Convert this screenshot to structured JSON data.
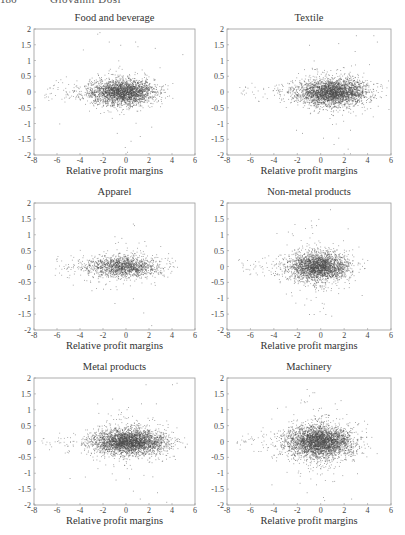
{
  "running_head": {
    "page_number": "186",
    "author": "Giovanni Dosi"
  },
  "chart_data": [
    {
      "type": "scatter",
      "title": "Food and beverage",
      "xlabel": "Relative profit margins",
      "ylabel": "",
      "xlim": [
        -8,
        6
      ],
      "ylim": [
        -2,
        2
      ],
      "xticks": [
        -8,
        -6,
        -4,
        -2,
        0,
        2,
        4,
        6
      ],
      "yticks": [
        2,
        1.5,
        1,
        0.5,
        0,
        -0.5,
        -1,
        -1.5,
        -2
      ],
      "grid": false,
      "cluster": {
        "center_x": -0.3,
        "center_y": 0.0,
        "sd_x": 1.4,
        "sd_y": 0.17,
        "n": 2600
      },
      "tail": {
        "x_min": -7.2,
        "x_max": 5.0
      },
      "outliers": [
        [
          -2.5,
          1.85
        ],
        [
          -2.3,
          1.9
        ],
        [
          -1.5,
          1.6
        ],
        [
          -0.5,
          1.5
        ],
        [
          0.8,
          1.6
        ],
        [
          1.0,
          1.45
        ],
        [
          2.5,
          1.4
        ],
        [
          4.9,
          1.2
        ],
        [
          -5.8,
          -1.0
        ],
        [
          -0.8,
          -1.3
        ],
        [
          0.4,
          -1.55
        ],
        [
          -0.1,
          -1.75
        ],
        [
          0.1,
          -1.9
        ],
        [
          1.2,
          -1.4
        ],
        [
          2.2,
          -1.1
        ]
      ]
    },
    {
      "type": "scatter",
      "title": "Textile",
      "xlabel": "Relative profit margins",
      "ylabel": "",
      "xlim": [
        -8,
        6
      ],
      "ylim": [
        -2,
        2
      ],
      "xticks": [
        -8,
        -6,
        -4,
        -2,
        0,
        2,
        4,
        6
      ],
      "yticks": [
        2,
        1.5,
        1,
        0.5,
        0,
        -0.5,
        -1,
        -1.5,
        -2
      ],
      "grid": false,
      "cluster": {
        "center_x": 1.0,
        "center_y": 0.0,
        "sd_x": 1.5,
        "sd_y": 0.18,
        "n": 3000
      },
      "tail": {
        "x_min": -7.0,
        "x_max": 5.8
      },
      "outliers": [
        [
          -1.0,
          1.5
        ],
        [
          1.5,
          1.55
        ],
        [
          3.0,
          1.8
        ],
        [
          4.5,
          1.8
        ],
        [
          4.8,
          1.6
        ],
        [
          2.9,
          1.3
        ],
        [
          -0.6,
          1.0
        ],
        [
          -2.1,
          -1.2
        ],
        [
          -1.6,
          -1.3
        ],
        [
          0.2,
          -1.45
        ],
        [
          1.1,
          -1.65
        ],
        [
          1.5,
          -1.45
        ],
        [
          2.3,
          -1.8
        ],
        [
          2.5,
          -1.95
        ],
        [
          2.5,
          -1.2
        ]
      ]
    },
    {
      "type": "scatter",
      "title": "Apparel",
      "xlabel": "Relative profit margins",
      "ylabel": "",
      "xlim": [
        -8,
        6
      ],
      "ylim": [
        -2,
        2
      ],
      "xticks": [
        -8,
        -6,
        -4,
        -2,
        0,
        2,
        4,
        6
      ],
      "yticks": [
        2,
        1.5,
        1,
        0.5,
        0,
        -0.5,
        -1,
        -1.5,
        -2
      ],
      "grid": false,
      "cluster": {
        "center_x": -0.2,
        "center_y": 0.0,
        "sd_x": 1.6,
        "sd_y": 0.15,
        "n": 1500
      },
      "tail": {
        "x_min": -6.2,
        "x_max": 5.5
      },
      "outliers": [
        [
          0.6,
          1.35
        ],
        [
          0.7,
          1.3
        ],
        [
          -1.0,
          0.95
        ],
        [
          -0.4,
          0.9
        ],
        [
          1.6,
          0.8
        ],
        [
          -3.0,
          -0.75
        ],
        [
          -2.0,
          -0.7
        ],
        [
          -1.0,
          -1.15
        ],
        [
          0.6,
          -1.0
        ],
        [
          1.5,
          -1.45
        ],
        [
          2.2,
          -1.85
        ]
      ]
    },
    {
      "type": "scatter",
      "title": "Non-metal products",
      "xlabel": "Relative profit margins",
      "ylabel": "",
      "xlim": [
        -8,
        6
      ],
      "ylim": [
        -2,
        2
      ],
      "xticks": [
        -8,
        -6,
        -4,
        -2,
        0,
        2,
        4,
        6
      ],
      "yticks": [
        2,
        1.5,
        1,
        0.5,
        0,
        -0.5,
        -1,
        -1.5,
        -2
      ],
      "grid": false,
      "cluster": {
        "center_x": -0.2,
        "center_y": 0.0,
        "sd_x": 1.3,
        "sd_y": 0.2,
        "n": 2600
      },
      "tail": {
        "x_min": -7.2,
        "x_max": 4.8
      },
      "outliers": [
        [
          0.8,
          1.8
        ],
        [
          -0.2,
          1.5
        ],
        [
          -0.8,
          1.3
        ],
        [
          -0.4,
          1.3
        ],
        [
          2.3,
          1.2
        ],
        [
          -2.8,
          1.1
        ],
        [
          -1.4,
          -1.2
        ],
        [
          -1.0,
          -1.5
        ],
        [
          -0.6,
          -1.5
        ],
        [
          0.4,
          -1.5
        ],
        [
          0.9,
          -1.55
        ],
        [
          0.2,
          -1.3
        ],
        [
          3.5,
          -0.9
        ]
      ]
    },
    {
      "type": "scatter",
      "title": "Metal products",
      "xlabel": "Relative profit margins",
      "ylabel": "",
      "xlim": [
        -8,
        6
      ],
      "ylim": [
        -2,
        2
      ],
      "xticks": [
        -8,
        -6,
        -4,
        -2,
        0,
        2,
        4,
        6
      ],
      "yticks": [
        2,
        1.5,
        1,
        0.5,
        0,
        -0.5,
        -1,
        -1.5,
        -2
      ],
      "grid": false,
      "cluster": {
        "center_x": 0.3,
        "center_y": 0.0,
        "sd_x": 1.6,
        "sd_y": 0.17,
        "n": 3200
      },
      "tail": {
        "x_min": -7.5,
        "x_max": 5.8
      },
      "outliers": [
        [
          1.7,
          1.8
        ],
        [
          4.0,
          1.8
        ],
        [
          4.4,
          1.85
        ],
        [
          -1.2,
          1.35
        ],
        [
          -2.5,
          1.2
        ],
        [
          2.6,
          1.2
        ],
        [
          1.3,
          1.2
        ],
        [
          -2.4,
          0.9
        ],
        [
          -4.9,
          -1.15
        ],
        [
          -0.9,
          -1.2
        ],
        [
          0.6,
          -1.55
        ],
        [
          1.2,
          -1.8
        ],
        [
          2.7,
          -1.6
        ],
        [
          3.5,
          -1.9
        ],
        [
          2.3,
          -1.1
        ]
      ]
    },
    {
      "type": "scatter",
      "title": "Machinery",
      "xlabel": "Relative profit margins",
      "ylabel": "",
      "xlim": [
        -8,
        6
      ],
      "ylim": [
        -2,
        2
      ],
      "xticks": [
        -8,
        -6,
        -4,
        -2,
        0,
        2,
        4,
        6
      ],
      "yticks": [
        2,
        1.5,
        1,
        0.5,
        0,
        -0.5,
        -1,
        -1.5,
        -2
      ],
      "grid": false,
      "cluster": {
        "center_x": -0.1,
        "center_y": 0.0,
        "sd_x": 1.4,
        "sd_y": 0.22,
        "n": 3400
      },
      "tail": {
        "x_min": -7.4,
        "x_max": 5.6
      },
      "outliers": [
        [
          -1.2,
          1.65
        ],
        [
          -0.7,
          1.55
        ],
        [
          -1.0,
          1.45
        ],
        [
          1.7,
          1.3
        ],
        [
          1.2,
          1.2
        ],
        [
          -3.0,
          1.1
        ],
        [
          -4.2,
          -1.35
        ],
        [
          -1.8,
          -1.3
        ],
        [
          -1.2,
          -1.6
        ],
        [
          -0.4,
          -1.35
        ],
        [
          0.2,
          -1.75
        ],
        [
          0.3,
          -1.85
        ],
        [
          1.0,
          -1.25
        ],
        [
          2.6,
          -1.8
        ],
        [
          3.1,
          -1.0
        ]
      ]
    }
  ],
  "style": {
    "axis_color": "#9a9a9a",
    "point_color": "#4a4a4a",
    "text_color": "#444444"
  }
}
